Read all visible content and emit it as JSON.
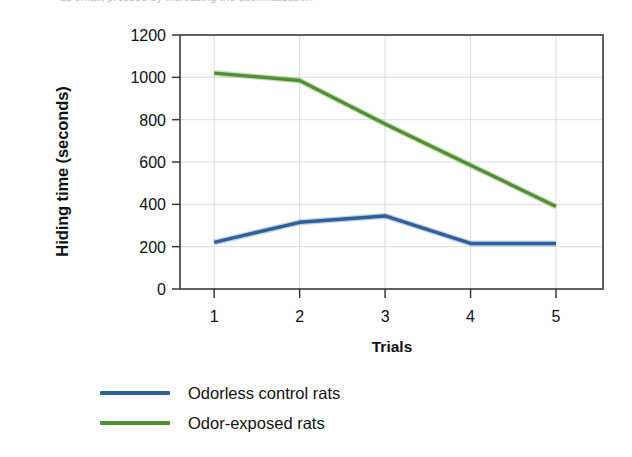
{
  "figure": {
    "top_clipped_text": "as small, pressed by increasing the acclimatization"
  },
  "chart_data": {
    "type": "line",
    "title": "",
    "xlabel": "Trials",
    "ylabel": "Hiding time (seconds)",
    "x": [
      1,
      2,
      3,
      4,
      5
    ],
    "categories": [
      "1",
      "2",
      "3",
      "4",
      "5"
    ],
    "xlim": [
      0.6,
      5.55
    ],
    "ylim": [
      0,
      1200
    ],
    "yticks": [
      0,
      200,
      400,
      600,
      800,
      1000,
      1200
    ],
    "ytick_labels": [
      "0",
      "200",
      "400",
      "600",
      "800",
      "1000",
      "1200"
    ],
    "xtick_labels": [
      "1",
      "2",
      "3",
      "4",
      "5"
    ],
    "grid": "both",
    "legend_position": "below-axis-left",
    "series": [
      {
        "name": "Odorless control rats",
        "color": "#2e5f9e",
        "values": [
          220,
          315,
          345,
          215,
          215
        ]
      },
      {
        "name": "Odor-exposed rats",
        "color": "#4f9130",
        "values": [
          1020,
          985,
          780,
          585,
          390
        ]
      }
    ]
  },
  "legend": {
    "items": [
      {
        "label": "Odorless control rats",
        "color": "#2e5f9e"
      },
      {
        "label": "Odor-exposed rats",
        "color": "#4f9130"
      }
    ]
  }
}
